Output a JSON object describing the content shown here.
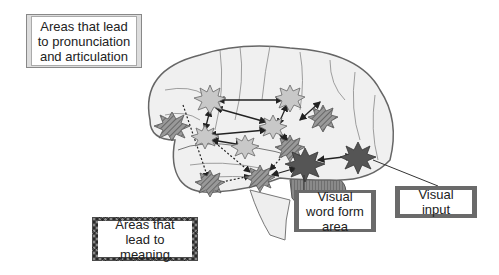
{
  "labels": {
    "pronunciation": "Areas that lead to pronunciation and articulation",
    "meaning": "Areas that lead to meaning",
    "visual_word_form": "Visual word form area",
    "visual_input": "Visual input"
  },
  "colors": {
    "brain_fill": "#f0f0f0",
    "brain_outline": "#666666",
    "pronunciation_node": "#c8c8c8",
    "meaning_node": "#8a8a8a",
    "vwfa_node": "#555555",
    "cerebellum": "#777777",
    "label_frame_dark": "#6a6a6a"
  }
}
